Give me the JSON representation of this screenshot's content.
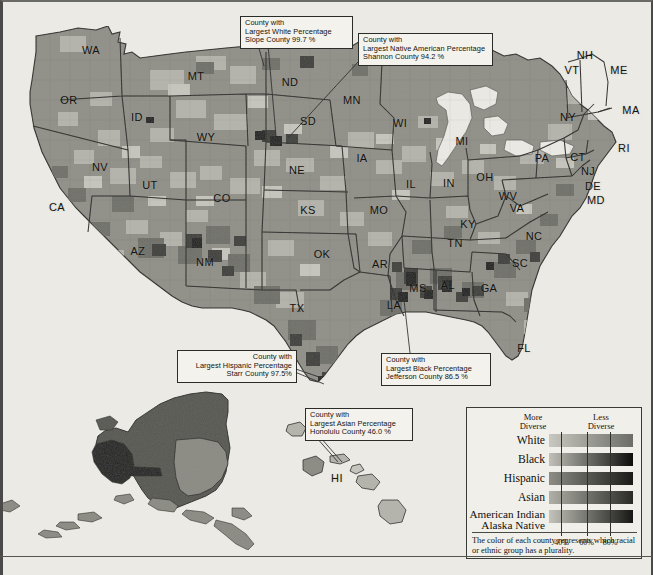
{
  "figure": {
    "type": "choropleth-map"
  },
  "state_labels": [
    {
      "abbr": "WA",
      "x": 91,
      "y": 50
    },
    {
      "abbr": "OR",
      "x": 69,
      "y": 100
    },
    {
      "abbr": "ID",
      "x": 137,
      "y": 117
    },
    {
      "abbr": "MT",
      "x": 196,
      "y": 76
    },
    {
      "abbr": "WY",
      "x": 206,
      "y": 137
    },
    {
      "abbr": "NV",
      "x": 100,
      "y": 167
    },
    {
      "abbr": "UT",
      "x": 150,
      "y": 185
    },
    {
      "abbr": "CA",
      "x": 57,
      "y": 207
    },
    {
      "abbr": "AZ",
      "x": 138,
      "y": 251
    },
    {
      "abbr": "NM",
      "x": 205,
      "y": 262
    },
    {
      "abbr": "CO",
      "x": 222,
      "y": 198
    },
    {
      "abbr": "ND",
      "x": 290,
      "y": 82
    },
    {
      "abbr": "SD",
      "x": 308,
      "y": 121
    },
    {
      "abbr": "NE",
      "x": 297,
      "y": 170
    },
    {
      "abbr": "KS",
      "x": 308,
      "y": 210
    },
    {
      "abbr": "OK",
      "x": 322,
      "y": 254
    },
    {
      "abbr": "TX",
      "x": 297,
      "y": 308
    },
    {
      "abbr": "MN",
      "x": 352,
      "y": 100
    },
    {
      "abbr": "IA",
      "x": 362,
      "y": 158
    },
    {
      "abbr": "MO",
      "x": 379,
      "y": 210
    },
    {
      "abbr": "AR",
      "x": 380,
      "y": 264
    },
    {
      "abbr": "LA",
      "x": 394,
      "y": 305
    },
    {
      "abbr": "WI",
      "x": 400,
      "y": 123
    },
    {
      "abbr": "IL",
      "x": 411,
      "y": 184
    },
    {
      "abbr": "IN",
      "x": 449,
      "y": 183
    },
    {
      "abbr": "MI",
      "x": 462,
      "y": 141
    },
    {
      "abbr": "OH",
      "x": 485,
      "y": 177
    },
    {
      "abbr": "KY",
      "x": 468,
      "y": 224
    },
    {
      "abbr": "TN",
      "x": 455,
      "y": 243
    },
    {
      "abbr": "MS",
      "x": 418,
      "y": 288
    },
    {
      "abbr": "AL",
      "x": 448,
      "y": 285
    },
    {
      "abbr": "GA",
      "x": 489,
      "y": 288
    },
    {
      "abbr": "FL",
      "x": 524,
      "y": 348
    },
    {
      "abbr": "SC",
      "x": 520,
      "y": 263
    },
    {
      "abbr": "NC",
      "x": 534,
      "y": 236
    },
    {
      "abbr": "VA",
      "x": 517,
      "y": 208
    },
    {
      "abbr": "WV",
      "x": 508,
      "y": 196
    },
    {
      "abbr": "PA",
      "x": 542,
      "y": 158
    },
    {
      "abbr": "NY",
      "x": 568,
      "y": 117
    },
    {
      "abbr": "VT",
      "x": 572,
      "y": 70
    },
    {
      "abbr": "NH",
      "x": 585,
      "y": 55
    },
    {
      "abbr": "ME",
      "x": 619,
      "y": 70
    },
    {
      "abbr": "MA",
      "x": 631,
      "y": 110
    },
    {
      "abbr": "RI",
      "x": 624,
      "y": 148
    },
    {
      "abbr": "CT",
      "x": 578,
      "y": 157
    },
    {
      "abbr": "NJ",
      "x": 588,
      "y": 171
    },
    {
      "abbr": "DE",
      "x": 593,
      "y": 186
    },
    {
      "abbr": "MD",
      "x": 596,
      "y": 200
    },
    {
      "abbr": "HI",
      "x": 337,
      "y": 478
    }
  ],
  "callouts": [
    {
      "id": "white",
      "lines": [
        "County with",
        "Largest White Percentage",
        "Slope County  99.7 %"
      ],
      "align": "left",
      "box": {
        "x": 240,
        "y": 16,
        "w": 103,
        "h": 29
      },
      "leader": [
        {
          "x1": 258,
          "y1": 45,
          "x2": 265,
          "y2": 63
        },
        {
          "x1": 266,
          "y1": 45,
          "x2": 277,
          "y2": 140
        }
      ]
    },
    {
      "id": "native-american",
      "lines": [
        "County with",
        "Largest Native American Percentage",
        "Shannon County  94.2 %"
      ],
      "align": "left",
      "box": {
        "x": 358,
        "y": 33,
        "w": 125,
        "h": 29
      },
      "leader": [
        {
          "x1": 358,
          "y1": 62,
          "x2": 288,
          "y2": 140
        }
      ]
    },
    {
      "id": "hispanic",
      "lines": [
        "County with",
        "Largest Hispanic Percentage",
        "Starr County  97.5%"
      ],
      "align": "right",
      "box": {
        "x": 177,
        "y": 350,
        "w": 110,
        "h": 29
      },
      "leader": [
        {
          "x1": 287,
          "y1": 370,
          "x2": 322,
          "y2": 381
        }
      ]
    },
    {
      "id": "black",
      "lines": [
        "County with",
        "Largest Black Percentage",
        "Jefferson County  86.5 %"
      ],
      "align": "left",
      "box": {
        "x": 381,
        "y": 353,
        "w": 100,
        "h": 29
      },
      "leader": [
        {
          "x1": 408,
          "y1": 353,
          "x2": 404,
          "y2": 300
        }
      ]
    },
    {
      "id": "asian",
      "lines": [
        "County with",
        "Largest Asian Percentage",
        "Honolulu County  46.0 %"
      ],
      "align": "left",
      "box": {
        "x": 305,
        "y": 408,
        "w": 98,
        "h": 29
      },
      "leader": [
        {
          "x1": 318,
          "y1": 437,
          "x2": 337,
          "y2": 462
        }
      ]
    }
  ],
  "legend": {
    "heading_left": "More\nDiverse",
    "heading_left_line1": "More",
    "heading_left_line2": "Diverse",
    "heading_right_line1": "Less",
    "heading_right_line2": "Diverse",
    "rows": [
      {
        "name": "White",
        "name_line2": "",
        "from": "#c8c8c0",
        "to": "#6d6d68"
      },
      {
        "name": "Black",
        "name_line2": "",
        "from": "#c0c0b8",
        "to": "#0d0d0c"
      },
      {
        "name": "Hispanic",
        "name_line2": "",
        "from": "#8d8d86",
        "to": "#1a1a18"
      },
      {
        "name": "Asian",
        "name_line2": "",
        "from": "#b0b0a8",
        "to": "#2a2a27"
      },
      {
        "name": "American Indian",
        "name_line2": "Alaska Native",
        "from": "#c3c3ba",
        "to": "#171715"
      }
    ],
    "ticks": [
      {
        "label": "40%",
        "pos": 0.22
      },
      {
        "label": "60%",
        "pos": 0.52
      },
      {
        "label": "80%",
        "pos": 0.8
      }
    ],
    "caption": "The color of each county represents which racial or ethnic group has a plurality."
  },
  "colors": {
    "page_background": "#eceae4",
    "ocean": "#eceae4",
    "map_base": "#8f8f88",
    "map_light": "#b4b4ac",
    "map_lighter": "#c5c5bd",
    "map_dark": "#575752",
    "map_darker": "#2e2e2b",
    "map_black": "#121210",
    "state_border": "#23231f",
    "county_border": "#77776f"
  }
}
